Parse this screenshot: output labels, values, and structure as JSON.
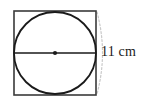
{
  "figure": {
    "type": "geometry-diagram",
    "colors": {
      "background": "#ffffff",
      "square_stroke": "#3a3a3a",
      "circle_stroke": "#1a1a1a",
      "diameter_stroke": "#1a1a1a",
      "center_dot": "#1a1a1a",
      "dashed_arc": "#c9c9c9",
      "label_text": "#1a1a1a"
    },
    "square": {
      "name": "bounding-square",
      "x": 14,
      "y": 11,
      "width": 82,
      "height": 84,
      "stroke_width": 1.6
    },
    "circle": {
      "name": "inscribed-circle",
      "cx": 55,
      "cy": 53,
      "r": 41,
      "stroke_width": 1.8
    },
    "diameter": {
      "name": "diameter-line",
      "x1": 14,
      "y1": 53,
      "x2": 96,
      "y2": 53,
      "stroke_width": 1.4
    },
    "center_point": {
      "name": "center-dot",
      "cx": 55,
      "cy": 53,
      "r": 2.1
    },
    "dashed_arc": {
      "name": "measure-arc",
      "path": "M 97 12 Q 108 53 97 94",
      "stroke_width": 1.2,
      "dash": "2 2"
    },
    "measurement": {
      "value": "11",
      "unit": "cm",
      "label": "11 cm"
    }
  }
}
